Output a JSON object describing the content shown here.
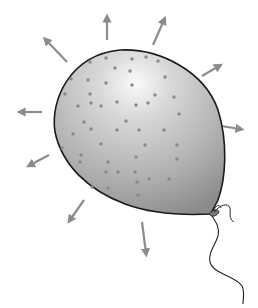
{
  "figure": {
    "colors": {
      "background": "#ffffff",
      "balloon_light": "#f4f4f4",
      "balloon_mid": "#c4c4c4",
      "balloon_dark": "#8e8e8e",
      "outline": "#1a1a1a",
      "dot": "#8a8a8a",
      "arrow": "#8c8c8c",
      "string": "#222222"
    },
    "arrows": [
      {
        "name": "arrow-up",
        "x1": 107,
        "y1": 40,
        "x2": 107,
        "y2": 18
      },
      {
        "name": "arrow-up-right",
        "x1": 153,
        "y1": 45,
        "x2": 164,
        "y2": 20
      },
      {
        "name": "arrow-up-left",
        "x1": 67,
        "y1": 62,
        "x2": 46,
        "y2": 40
      },
      {
        "name": "arrow-right-upper",
        "x1": 202,
        "y1": 76,
        "x2": 219,
        "y2": 66
      },
      {
        "name": "arrow-left",
        "x1": 42,
        "y1": 112,
        "x2": 21,
        "y2": 112
      },
      {
        "name": "arrow-right",
        "x1": 221,
        "y1": 126,
        "x2": 240,
        "y2": 129
      },
      {
        "name": "arrow-left-lower",
        "x1": 49,
        "y1": 155,
        "x2": 30,
        "y2": 165
      },
      {
        "name": "arrow-down-left",
        "x1": 84,
        "y1": 200,
        "x2": 70,
        "y2": 220
      },
      {
        "name": "arrow-down",
        "x1": 142,
        "y1": 222,
        "x2": 146,
        "y2": 253
      }
    ],
    "dots": [
      [
        90,
        62
      ],
      [
        106,
        58
      ],
      [
        132,
        59
      ],
      [
        146,
        57
      ],
      [
        158,
        61
      ],
      [
        71,
        79
      ],
      [
        88,
        80
      ],
      [
        115,
        68
      ],
      [
        130,
        71
      ],
      [
        165,
        77
      ],
      [
        106,
        83
      ],
      [
        132,
        85
      ],
      [
        65,
        94
      ],
      [
        90,
        94
      ],
      [
        155,
        95
      ],
      [
        174,
        97
      ],
      [
        78,
        106
      ],
      [
        91,
        103
      ],
      [
        101,
        106
      ],
      [
        117,
        102
      ],
      [
        136,
        105
      ],
      [
        148,
        103
      ],
      [
        179,
        114
      ],
      [
        84,
        122
      ],
      [
        126,
        121
      ],
      [
        91,
        129
      ],
      [
        117,
        130
      ],
      [
        139,
        130
      ],
      [
        164,
        130
      ],
      [
        73,
        134
      ],
      [
        101,
        144
      ],
      [
        145,
        145
      ],
      [
        177,
        145
      ],
      [
        62,
        148
      ],
      [
        81,
        155
      ],
      [
        108,
        162
      ],
      [
        136,
        157
      ],
      [
        177,
        159
      ],
      [
        80,
        162
      ],
      [
        106,
        172
      ],
      [
        118,
        172
      ],
      [
        135,
        172
      ],
      [
        149,
        179
      ],
      [
        169,
        179
      ],
      [
        137,
        182
      ],
      [
        92,
        187
      ],
      [
        108,
        188
      ],
      [
        138,
        195
      ]
    ]
  }
}
